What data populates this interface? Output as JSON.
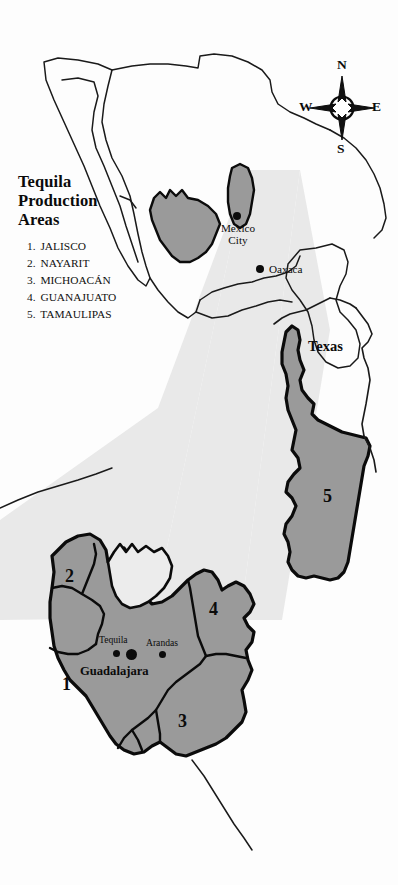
{
  "legend": {
    "title_lines": [
      "Tequila",
      "Production",
      "Areas"
    ],
    "title_line1": "Tequila",
    "title_line2": "Production",
    "title_line3": "Areas",
    "items": [
      {
        "number": "1.",
        "label": "JALISCO"
      },
      {
        "number": "2.",
        "label": "NAYARIT"
      },
      {
        "number": "3.",
        "label": "MICHOACÁN"
      },
      {
        "number": "4.",
        "label": "GUANAJUATO"
      },
      {
        "number": "5.",
        "label": "TAMAULIPAS"
      }
    ]
  },
  "compass": {
    "north": "N",
    "east": "E",
    "south": "S",
    "west": "W"
  },
  "overview_map": {
    "cities": [
      {
        "name": "Mexico City",
        "line1": "Mexico",
        "line2": "City"
      },
      {
        "name": "Oaxaca",
        "label": "Oaxaca"
      }
    ],
    "state_labels": [
      {
        "name": "Texas",
        "label": "Texas"
      }
    ]
  },
  "detail_map": {
    "cities": [
      {
        "name": "Tequila",
        "label": "Tequila"
      },
      {
        "name": "Arandas",
        "label": "Arandas"
      },
      {
        "name": "Guadalajara",
        "label": "Guadalajara"
      }
    ],
    "region_numbers": [
      {
        "id": "1",
        "label": "1",
        "state": "JALISCO"
      },
      {
        "id": "2",
        "label": "2",
        "state": "NAYARIT"
      },
      {
        "id": "3",
        "label": "3",
        "state": "MICHOACÁN"
      },
      {
        "id": "4",
        "label": "4",
        "state": "GUANAJUATO"
      },
      {
        "id": "5",
        "label": "5",
        "state": "TAMAULIPAS"
      }
    ]
  },
  "colors": {
    "background": "#fdfdfd",
    "state_fill": "#999999",
    "zoom_wedge": "#e9e9e9",
    "outline": "#0b0b0b",
    "coastline_thin": "#1a1a1a",
    "text": "#0b0b0b"
  }
}
